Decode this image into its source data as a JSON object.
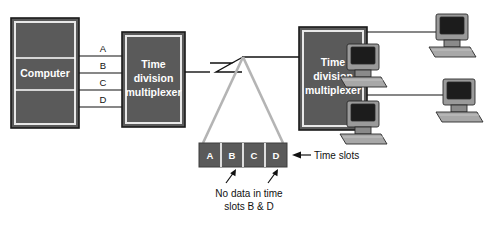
{
  "diagram": {
    "source_box": {
      "label": "Computer",
      "name": "computer-box"
    },
    "mux_left": {
      "label_lines": [
        "Time",
        "division",
        "multiplexer"
      ],
      "name": "time-division-multiplexer-left"
    },
    "mux_right": {
      "label_lines": [
        "Time",
        "division",
        "multiplexer"
      ],
      "name": "time-division-multiplexer-right"
    },
    "channel_labels": [
      "A",
      "B",
      "C",
      "D"
    ],
    "time_slots": {
      "slots": [
        "A",
        "B",
        "C",
        "D"
      ],
      "callout_label": "Time slots"
    },
    "annotation": {
      "line1": "No data in time",
      "line2": "slots B & D",
      "points_to": [
        "B",
        "D"
      ]
    },
    "terminals": [
      {
        "name": "terminal-1"
      },
      {
        "name": "terminal-2"
      },
      {
        "name": "terminal-3"
      },
      {
        "name": "terminal-4"
      }
    ],
    "colors": {
      "box_fill": "#5a5a5a",
      "box_inner_border": "#e8e8e8",
      "box_outer_border": "#1a1a1a",
      "wire": "#111111",
      "funnel": "#b4b4b4",
      "background": "#ffffff",
      "text_dark": "#111111",
      "text_light": "#ffffff"
    }
  }
}
